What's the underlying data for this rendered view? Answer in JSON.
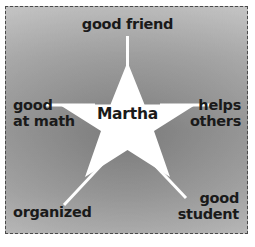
{
  "diagram": {
    "type": "star-graphic-organizer",
    "title_center": "Martha",
    "frame_border_color": "#4a4a4a",
    "star_fill_color": "#ffffff",
    "background_color": "#bfbfbf",
    "text_color": "#1a1a1a",
    "center_label": {
      "name": "center-name",
      "text": "Martha"
    },
    "points": [
      {
        "id": "top",
        "position": "top",
        "text": "good friend"
      },
      {
        "id": "left",
        "position": "left",
        "text": "good\nat math"
      },
      {
        "id": "right",
        "position": "right",
        "text": "helps\nothers"
      },
      {
        "id": "bottom-left",
        "position": "bottom-left",
        "text": "organized"
      },
      {
        "id": "bottom-right",
        "position": "bottom-right",
        "text": "good\nstudent"
      }
    ]
  }
}
